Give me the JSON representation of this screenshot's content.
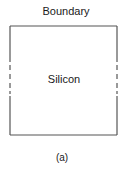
{
  "diagram": {
    "title": "Boundary",
    "region_label": "Silicon",
    "caption": "(a)",
    "box": {
      "left": 10,
      "right": 117,
      "top": 26,
      "bottom": 135,
      "solid_side_top_end": 62,
      "solid_side_bottom_start": 96,
      "dash_segments": [
        [
          65,
          70
        ],
        [
          74,
          79
        ],
        [
          83,
          88
        ],
        [
          92,
          95
        ]
      ],
      "stroke_color": "#555555"
    }
  }
}
